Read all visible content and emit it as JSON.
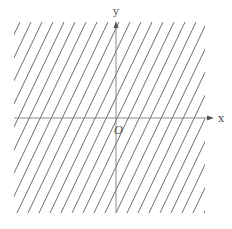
{
  "diagram": {
    "type": "cartesian-plane-hatched-region",
    "axes": {
      "x_label": "x",
      "y_label": "y",
      "origin_label": "O"
    },
    "hatching": {
      "description": "parallel lines with positive slope filling the whole plane",
      "slope_screen": 2.1,
      "spacing_px": 11,
      "line_color": "#6e6e6e"
    },
    "colors": {
      "axis": "#8a8a8a",
      "hatch": "#6e6e6e",
      "label": "#555555",
      "background": "#ffffff"
    }
  }
}
